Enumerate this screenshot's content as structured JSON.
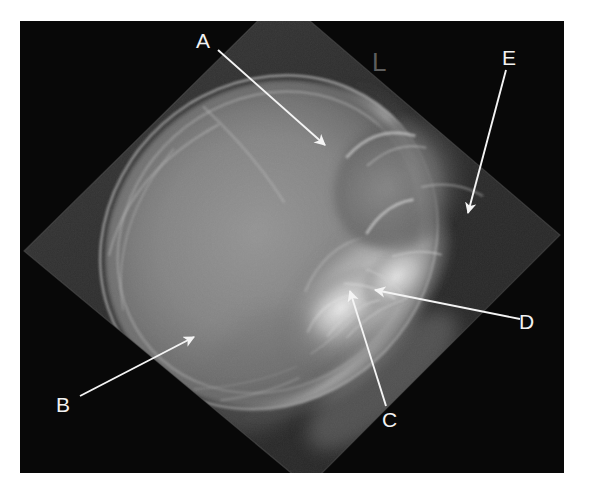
{
  "figure": {
    "kind": "radiograph",
    "modality": "x-ray",
    "view": "lateral skull radiograph",
    "background_color": "#ffffff",
    "frame_color": "#070707",
    "annotation_color": "#f2f2f2",
    "marker_color": "#5d5d5d"
  },
  "side_marker": {
    "name": "left-side-marker",
    "text": "L"
  },
  "annotations": [
    {
      "id": "A",
      "label": "A",
      "label_x": 196,
      "label_y": 30,
      "arrow_start_x": 218,
      "arrow_start_y": 50,
      "arrow_end_x": 327,
      "arrow_end_y": 146
    },
    {
      "id": "B",
      "label": "B",
      "label_x": 56,
      "label_y": 394,
      "arrow_start_x": 80,
      "arrow_start_y": 396,
      "arrow_end_x": 196,
      "arrow_end_y": 338
    },
    {
      "id": "C",
      "label": "C",
      "label_x": 382,
      "label_y": 409,
      "arrow_start_x": 386,
      "arrow_start_y": 406,
      "arrow_end_x": 350,
      "arrow_end_y": 290
    },
    {
      "id": "D",
      "label": "D",
      "label_x": 519,
      "label_y": 311,
      "arrow_start_x": 514,
      "arrow_start_y": 318,
      "arrow_end_x": 373,
      "arrow_end_y": 290
    },
    {
      "id": "E",
      "label": "E",
      "label_x": 502,
      "label_y": 47,
      "arrow_start_x": 506,
      "arrow_start_y": 70,
      "arrow_end_x": 468,
      "arrow_end_y": 214
    }
  ]
}
